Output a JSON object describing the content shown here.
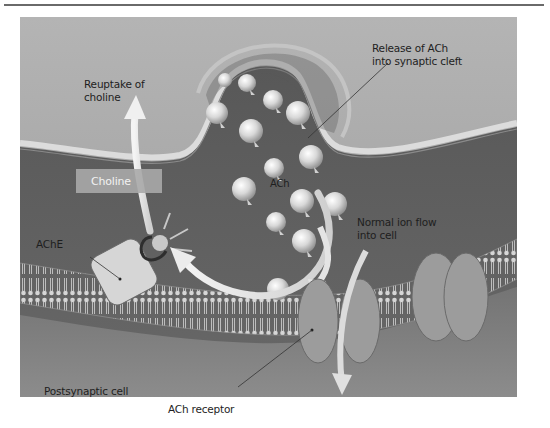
{
  "figure": {
    "labels": {
      "reuptake": [
        "Reuptake of",
        "choline"
      ],
      "release": [
        "Release of ACh",
        "into synaptic cleft"
      ],
      "choline_box": "Choline",
      "ach_molecule": "ACh",
      "ache": "AChE",
      "ion_flow": [
        "Normal ion flow",
        "into cell"
      ],
      "postsynaptic": "Postsynaptic cell",
      "receptor": "ACh receptor"
    },
    "colors": {
      "presynaptic_fill": "#a8a8a8",
      "cleft_fill": "#5c5c5c",
      "membrane_light": "#d8d8d8",
      "vesicle": "#e6e6e6",
      "receptor": "#9a9a9a",
      "postsynaptic_fill": "#7a7a7a",
      "arrow": "#e8e8e8"
    }
  }
}
